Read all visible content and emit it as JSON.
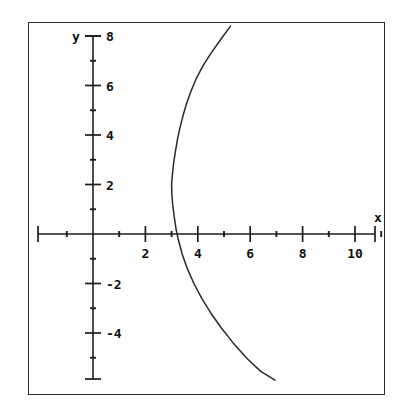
{
  "figure": {
    "background_color": "#ffffff",
    "frame_color": "#2b2b2b",
    "axis_color": "#1c1c1c",
    "curve_color": "#2a2a2a"
  },
  "chart_data": {
    "type": "line",
    "title": "",
    "subtitle": "",
    "xlabel": "x",
    "ylabel": "y",
    "grid": false,
    "legend": null,
    "xlim": [
      -1.6,
      11.9
    ],
    "ylim": [
      -5.9,
      8.45
    ],
    "x_axis": {
      "label": "x",
      "major_ticks": [
        2,
        4,
        6,
        8,
        10
      ],
      "major_tick_labels": [
        "2",
        "4",
        "6",
        "8",
        "10"
      ],
      "minor_ticks": [
        -1,
        1,
        3,
        5,
        7,
        9,
        11
      ],
      "tick_interval": 1,
      "label_interval": 2
    },
    "y_axis": {
      "label": "y",
      "major_ticks": [
        -4,
        -2,
        2,
        4,
        6,
        8
      ],
      "major_tick_labels": [
        "-4",
        "-2",
        "2",
        "4",
        "6",
        "8"
      ],
      "minor_ticks": [
        -5,
        -3,
        -1,
        1,
        3,
        5,
        7
      ],
      "tick_interval": 1,
      "label_interval": 2
    },
    "series": [
      {
        "name": "parabola",
        "description": "rightward-opening parabola, vertex near (3, 2)",
        "vertex": [
          3,
          2
        ],
        "x_intercept": 3.25,
        "points": [
          [
            5.25,
            8.4
          ],
          [
            4.9,
            7.9
          ],
          [
            4.5,
            7.3
          ],
          [
            4.2,
            6.8
          ],
          [
            3.95,
            6.3
          ],
          [
            3.75,
            5.8
          ],
          [
            3.58,
            5.3
          ],
          [
            3.44,
            4.8
          ],
          [
            3.32,
            4.3
          ],
          [
            3.22,
            3.8
          ],
          [
            3.14,
            3.3
          ],
          [
            3.07,
            2.8
          ],
          [
            3.03,
            2.4
          ],
          [
            3.0,
            2.0
          ],
          [
            3.01,
            1.6
          ],
          [
            3.04,
            1.2
          ],
          [
            3.1,
            0.7
          ],
          [
            3.17,
            0.2
          ],
          [
            3.25,
            -0.2
          ],
          [
            3.4,
            -0.8
          ],
          [
            3.6,
            -1.4
          ],
          [
            3.85,
            -2.0
          ],
          [
            4.15,
            -2.6
          ],
          [
            4.5,
            -3.2
          ],
          [
            4.9,
            -3.8
          ],
          [
            5.35,
            -4.4
          ],
          [
            5.85,
            -5.0
          ],
          [
            6.4,
            -5.55
          ],
          [
            6.95,
            -5.9
          ]
        ]
      }
    ]
  },
  "labels": {
    "x_axis_name": "x",
    "y_axis_name": "y",
    "x_ticks": [
      "2",
      "4",
      "6",
      "8",
      "10"
    ],
    "y_ticks_positive": [
      "2",
      "4",
      "6",
      "8"
    ],
    "y_ticks_negative": [
      "-2",
      "-4"
    ]
  }
}
